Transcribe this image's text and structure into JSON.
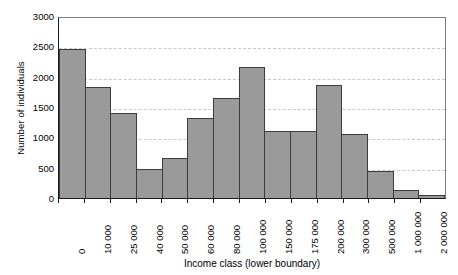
{
  "chart_data": {
    "type": "bar",
    "title": "",
    "subtitle": "",
    "xlabel": "Income class (lower boundary)",
    "ylabel": "Number of individuals",
    "categories": [
      "0",
      "10 000",
      "25 000",
      "40 000",
      "50 000",
      "60 000",
      "80 000",
      "100 000",
      "150 000",
      "175 000",
      "200 000",
      "300 000",
      "500 000",
      "1 000 000",
      "2 000 000"
    ],
    "values": [
      2450,
      1835,
      1400,
      480,
      660,
      1320,
      1650,
      2155,
      1110,
      1110,
      1865,
      1055,
      450,
      135,
      50
    ],
    "ylim": [
      0,
      3000
    ],
    "yticks": [
      0,
      500,
      1000,
      1500,
      2000,
      2500,
      3000
    ],
    "ytick_labels": [
      "0",
      "500",
      "1000",
      "1500",
      "2000",
      "2500",
      "3000"
    ],
    "grid": "horizontal-dashed",
    "legend": "none",
    "bar_fill_color": "#9a9a9a",
    "bar_edge_color": "#3c3c3c",
    "axis_color": "#1a1a1a",
    "grid_color": "#c9c9c9"
  }
}
